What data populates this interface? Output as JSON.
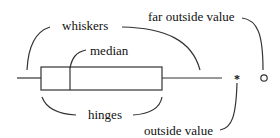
{
  "diagram": {
    "type": "boxplot-anatomy",
    "labels": {
      "whiskers": "whiskers",
      "median": "median",
      "hinges": "hinges",
      "outside_value": "outside value",
      "far_outside_value": "far outside value"
    },
    "markers": {
      "outside_value_symbol": "*",
      "far_outside_value_symbol": "o"
    },
    "colors": {
      "stroke": "#333333",
      "text": "#111111",
      "background": "#ffffff"
    }
  }
}
